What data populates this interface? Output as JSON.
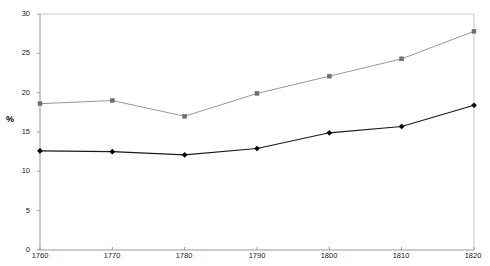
{
  "chart_data": {
    "type": "line",
    "title": "",
    "xlabel": "",
    "ylabel": "%",
    "x": [
      1760,
      1770,
      1780,
      1790,
      1800,
      1810,
      1820
    ],
    "xtick_labels": [
      "1760",
      "1770",
      "1780",
      "1790",
      "1800",
      "1810",
      "1820"
    ],
    "ytick_labels": [
      "0",
      "5",
      "10",
      "15",
      "20",
      "25",
      "30"
    ],
    "yticks": [
      0,
      5,
      10,
      15,
      20,
      25,
      30
    ],
    "xlim": [
      1760,
      1820
    ],
    "ylim": [
      0,
      30
    ],
    "grid": false,
    "legend": "none",
    "series": [
      {
        "name": "upper-series",
        "values": [
          18.6,
          19.0,
          17.0,
          19.9,
          22.1,
          24.3,
          27.8
        ],
        "color": "#8c8c8c",
        "marker": "square",
        "marker_color": "#6e6e6e"
      },
      {
        "name": "lower-series",
        "values": [
          12.6,
          12.5,
          12.1,
          12.9,
          14.9,
          15.7,
          18.4
        ],
        "color": "#1a1a1a",
        "marker": "diamond",
        "marker_color": "#000000"
      }
    ]
  },
  "axes": {
    "y_axis_label": "%",
    "y_ticks": [
      "30",
      "25",
      "20",
      "15",
      "10",
      "5",
      "0"
    ],
    "x_ticks": [
      "1760",
      "1770",
      "1780",
      "1790",
      "1800",
      "1810",
      "1820"
    ]
  },
  "colors": {
    "upper_line": "#8c8c8c",
    "lower_line": "#1a1a1a",
    "axis": "#9a9a9a",
    "plot_border": "#c8c8c8",
    "background": "#ffffff",
    "text": "#1a1a1a"
  }
}
